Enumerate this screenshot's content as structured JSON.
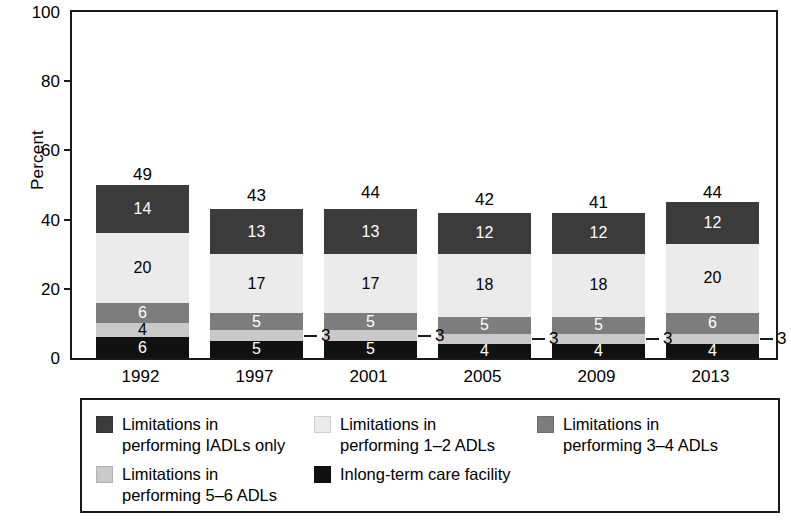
{
  "chart_data": {
    "type": "bar",
    "subtype": "stacked-bar",
    "title": "",
    "xlabel": "",
    "ylabel": "Percent",
    "ylim": [
      0,
      100
    ],
    "yticks": [
      0,
      20,
      40,
      60,
      80,
      100
    ],
    "grid": false,
    "legend_position": "bottom",
    "categories": [
      "1992",
      "1997",
      "2001",
      "2005",
      "2009",
      "2013"
    ],
    "series": [
      {
        "name": "Inlong-term care facility",
        "color": "#111111",
        "values": [
          6,
          5,
          5,
          4,
          4,
          4
        ],
        "label_color": "light"
      },
      {
        "name": "Limitations in performing 5–6 ADLs",
        "color": "#c9c9c9",
        "values": [
          4,
          3,
          3,
          3,
          3,
          3
        ],
        "label_color": "dark"
      },
      {
        "name": "Limitations in performing 3–4 ADLs",
        "color": "#7d7d7d",
        "values": [
          6,
          5,
          5,
          5,
          5,
          6
        ],
        "label_color": "light"
      },
      {
        "name": "Limitations in performing 1–2 ADLs",
        "color": "#ebebeb",
        "values": [
          20,
          17,
          17,
          18,
          18,
          20
        ],
        "label_color": "dark"
      },
      {
        "name": "Limitations in performing IADLs only",
        "color": "#3b3b3b",
        "values": [
          14,
          13,
          13,
          12,
          12,
          12
        ],
        "label_color": "light"
      }
    ],
    "totals": [
      49,
      43,
      44,
      42,
      41,
      44
    ],
    "segment_labels": {
      "1992": [
        "6",
        "4",
        "6",
        "20",
        "14"
      ],
      "1997": [
        "5",
        "3",
        "5",
        "17",
        "13"
      ],
      "2001": [
        "5",
        "3",
        "5",
        "17",
        "13"
      ],
      "2005": [
        "4",
        "3",
        "5",
        "18",
        "12"
      ],
      "2009": [
        "4",
        "3",
        "5",
        "18",
        "12"
      ],
      "2013": [
        "4",
        "3",
        "6",
        "20",
        "12"
      ]
    },
    "external_callouts": [
      {
        "category": "1997",
        "value": "3"
      },
      {
        "category": "2001",
        "value": "3"
      },
      {
        "category": "2005",
        "value": "3"
      },
      {
        "category": "2009",
        "value": "3"
      },
      {
        "category": "2013",
        "value": "3"
      }
    ]
  },
  "axes": {
    "y_title": "Percent",
    "y_tick_labels": [
      "0",
      "20",
      "40",
      "60",
      "80",
      "100"
    ],
    "x_tick_labels": [
      "1992",
      "1997",
      "2001",
      "2005",
      "2009",
      "2013"
    ]
  },
  "bar_totals": {
    "b0": "49",
    "b1": "43",
    "b2": "44",
    "b3": "42",
    "b4": "41",
    "b5": "44"
  },
  "legend": {
    "items": [
      {
        "label": "Limitations in\nperforming IADLs only",
        "color": "#3b3b3b",
        "swatch_name": "legend-swatch-iadls-only"
      },
      {
        "label": "Limitations in\nperforming 1–2 ADLs",
        "color": "#ebebeb",
        "swatch_name": "legend-swatch-1-2-adls"
      },
      {
        "label": "Limitations in\nperforming 3–4 ADLs",
        "color": "#7d7d7d",
        "swatch_name": "legend-swatch-3-4-adls"
      },
      {
        "label": "Limitations in\nperforming 5–6 ADLs",
        "color": "#c9c9c9",
        "swatch_name": "legend-swatch-5-6-adls"
      },
      {
        "label": "Inlong-term care facility",
        "color": "#111111",
        "swatch_name": "legend-swatch-long-term-care"
      }
    ]
  },
  "colors": {
    "axis": "#1a1a1a",
    "background": "#ffffff",
    "iadls_only": "#3b3b3b",
    "adls_1_2": "#ebebeb",
    "adls_3_4": "#7d7d7d",
    "adls_5_6": "#c9c9c9",
    "long_term_care": "#111111"
  }
}
